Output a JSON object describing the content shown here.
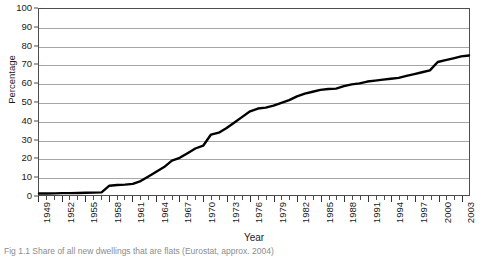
{
  "figure": {
    "caption": "Fig 1.1 Share of all new dwellings that are flats (Eurostat, approx. 2004)"
  },
  "chart_data": {
    "type": "line",
    "title": "",
    "xlabel": "Year",
    "ylabel": "Percentage",
    "ylim": [
      0,
      100
    ],
    "ytick_step": 10,
    "yticks": [
      0,
      10,
      20,
      30,
      40,
      50,
      60,
      70,
      80,
      90,
      100
    ],
    "xlim": [
      1949,
      2004
    ],
    "xtick_labels": [
      "1949",
      "1952",
      "1955",
      "1958",
      "1961",
      "1964",
      "1967",
      "1970",
      "1973",
      "1976",
      "1979",
      "1982",
      "1985",
      "1988",
      "1991",
      "1994",
      "1997",
      "2000",
      "2003"
    ],
    "xtick_step": 3,
    "grid": "horizontal",
    "legend": "none",
    "line_color": "#000000",
    "line_width": 2.4,
    "x": [
      1949,
      1950,
      1951,
      1952,
      1953,
      1954,
      1955,
      1956,
      1957,
      1958,
      1959,
      1960,
      1961,
      1962,
      1963,
      1964,
      1965,
      1966,
      1967,
      1968,
      1969,
      1970,
      1971,
      1972,
      1973,
      1974,
      1975,
      1976,
      1977,
      1978,
      1979,
      1980,
      1981,
      1982,
      1983,
      1984,
      1985,
      1986,
      1987,
      1988,
      1989,
      1990,
      1991,
      1992,
      1993,
      1994,
      1995,
      1996,
      1997,
      1998,
      1999,
      2000,
      2001,
      2002,
      2003,
      2004
    ],
    "values": [
      0.8,
      0.8,
      0.9,
      1.0,
      1.0,
      1.1,
      1.2,
      1.3,
      1.4,
      5.0,
      5.4,
      5.6,
      6.0,
      7.5,
      10.0,
      12.5,
      15.0,
      18.5,
      20.0,
      22.5,
      25.0,
      26.5,
      32.5,
      33.5,
      36.0,
      39.0,
      42.0,
      45.0,
      46.5,
      47.0,
      48.0,
      49.5,
      51.0,
      53.0,
      54.5,
      55.5,
      56.5,
      57.0,
      57.2,
      58.5,
      59.5,
      60.0,
      61.0,
      61.5,
      62.0,
      62.5,
      63.0,
      64.0,
      65.0,
      66.0,
      67.0,
      71.5,
      72.5,
      73.5,
      74.5,
      75.0
    ]
  }
}
